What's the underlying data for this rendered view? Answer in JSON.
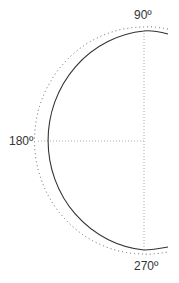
{
  "diagram": {
    "type": "polar-half-arc",
    "labels": {
      "top": "90º",
      "left": "180º",
      "bottom": "270º"
    },
    "colors": {
      "solid_arc": "#333333",
      "dotted_arc": "#555555",
      "guide_lines": "#999999",
      "label_text": "#333333"
    },
    "geometry": {
      "center": [
        144,
        141
      ],
      "solid_radius_x": 106,
      "solid_radius_y": 110,
      "dotted_offset": 3
    }
  }
}
